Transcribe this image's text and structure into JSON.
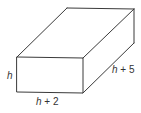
{
  "figure": {
    "type": "rectangular-prism",
    "stroke_color": "#3a3a3a",
    "background": "#ffffff",
    "vertices": {
      "front_top_left": [
        17,
        57
      ],
      "front_top_right": [
        83,
        58
      ],
      "front_bottom_left": [
        17,
        92
      ],
      "front_bottom_right": [
        83,
        93
      ],
      "back_top_left": [
        67,
        8
      ],
      "back_top_right": [
        134,
        9
      ],
      "back_bottom_right": [
        134,
        43
      ]
    }
  },
  "labels": {
    "height": {
      "variable": "h",
      "suffix": ""
    },
    "width": {
      "variable": "h",
      "suffix": " + 2"
    },
    "depth": {
      "variable": "h",
      "suffix": " + 5"
    }
  }
}
